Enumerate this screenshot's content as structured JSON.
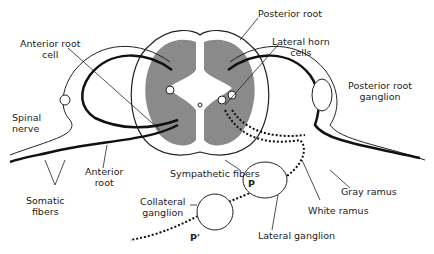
{
  "diagram": {
    "labels": {
      "anterior_root_cell": [
        "Anterior root",
        "cell"
      ],
      "posterior_root": "Posterior root",
      "lateral_horn_cells": [
        "Lateral horn",
        "cells"
      ],
      "posterior_root_ganglion": [
        "Posterior root",
        "ganglion"
      ],
      "spinal_nerve": [
        "Spinal",
        "nerve"
      ],
      "anterior_root": [
        "Anterior",
        "root"
      ],
      "somatic_fibers": [
        "Somatic",
        "fibers"
      ],
      "sympathetic_fibers": "Sympathetic fibers",
      "collateral_ganglion": [
        "Collateral",
        "ganglion"
      ],
      "gray_ramus": "Gray ramus",
      "white_ramus": "White ramus",
      "lateral_ganglion": "Lateral ganglion",
      "p": "P",
      "p_prime": "P'"
    },
    "colors": {
      "gray_matter": "#8a8a8a",
      "line": "#111111",
      "background": "#ffffff"
    }
  }
}
